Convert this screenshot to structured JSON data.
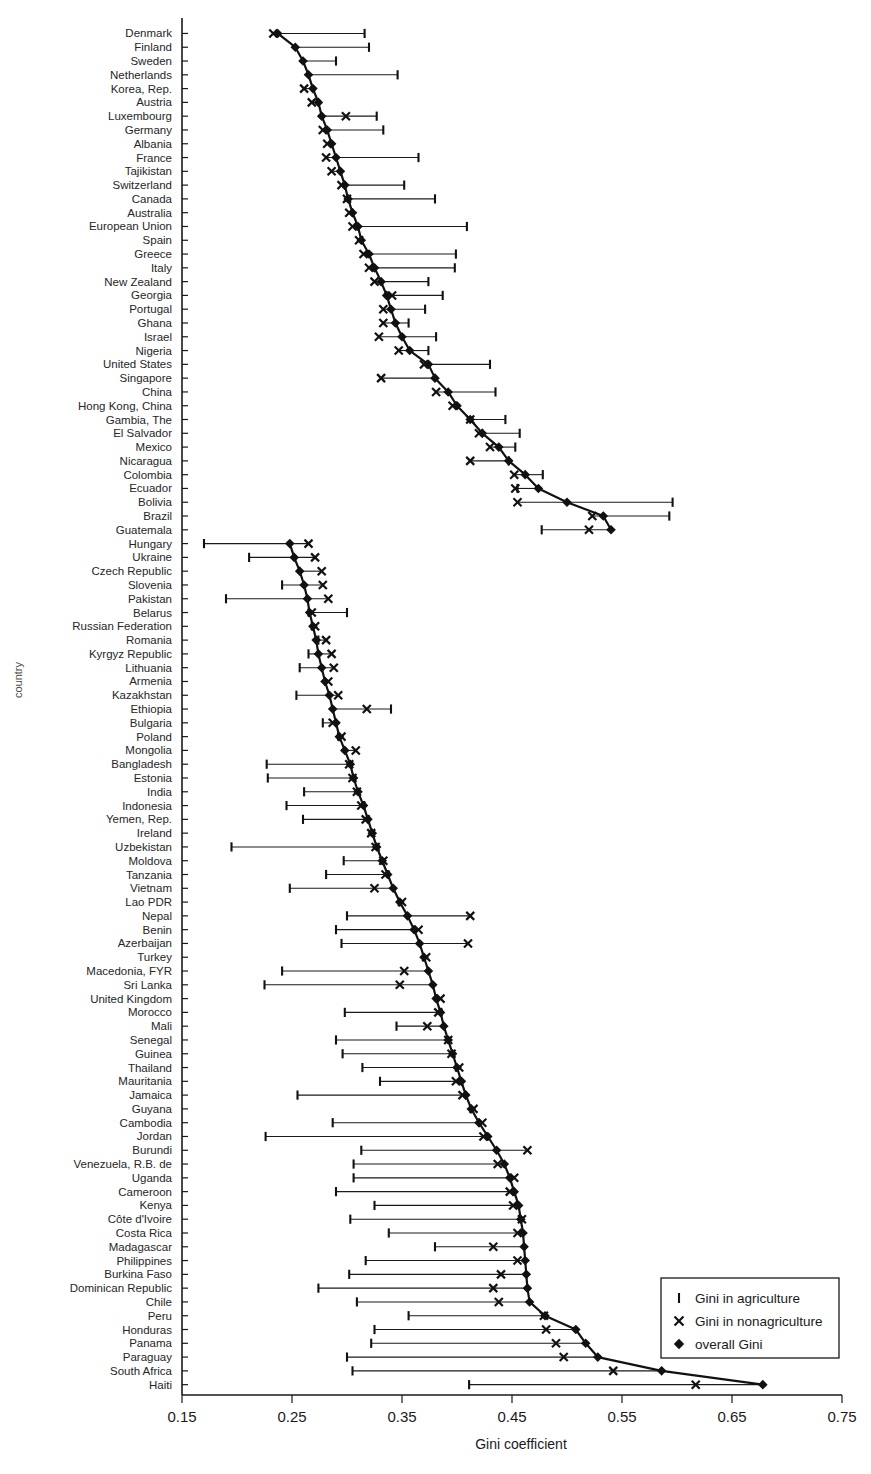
{
  "chart_data": {
    "type": "scatter",
    "title": "",
    "xlabel": "Gini coefficient",
    "ylabel": "country",
    "xlim": [
      0.15,
      0.75
    ],
    "ylim_note": "categorical, 101 countries ordered by overall Gini within two sorted groups",
    "grid": false,
    "xticks": [
      "0.15",
      "0.25",
      "0.35",
      "0.45",
      "0.55",
      "0.65",
      "0.75"
    ],
    "xtick_values": [
      0.15,
      0.25,
      0.35,
      0.45,
      0.55,
      0.65,
      0.75
    ],
    "legend_position": "bottom-right",
    "legend": [
      {
        "key": "agriculture",
        "marker": "vertical-bar",
        "label": "Gini in agriculture"
      },
      {
        "key": "nonagriculture",
        "marker": "x-cross",
        "label": "Gini in nonagriculture"
      },
      {
        "key": "overall",
        "marker": "diamond",
        "label": "overall Gini"
      }
    ],
    "series_names": [
      "Gini in agriculture",
      "Gini in nonagriculture",
      "overall Gini"
    ],
    "categories": [
      "Denmark",
      "Finland",
      "Sweden",
      "Netherlands",
      "Korea, Rep.",
      "Austria",
      "Luxembourg",
      "Germany",
      "Albania",
      "France",
      "Tajikistan",
      "Switzerland",
      "Canada",
      "Australia",
      "European Union",
      "Spain",
      "Greece",
      "Italy",
      "New Zealand",
      "Georgia",
      "Portugal",
      "Ghana",
      "Israel",
      "Nigeria",
      "United States",
      "Singapore",
      "China",
      "Hong Kong, China",
      "Gambia, The",
      "El Salvador",
      "Mexico",
      "Nicaragua",
      "Colombia",
      "Ecuador",
      "Bolivia",
      "Brazil",
      "Guatemala",
      "Hungary",
      "Ukraine",
      "Czech Republic",
      "Slovenia",
      "Pakistan",
      "Belarus",
      "Russian Federation",
      "Romania",
      "Kyrgyz Republic",
      "Lithuania",
      "Armenia",
      "Kazakhstan",
      "Ethiopia",
      "Bulgaria",
      "Poland",
      "Mongolia",
      "Bangladesh",
      "Estonia",
      "India",
      "Indonesia",
      "Yemen, Rep.",
      "Ireland",
      "Uzbekistan",
      "Moldova",
      "Tanzania",
      "Vietnam",
      "Lao PDR",
      "Nepal",
      "Benin",
      "Azerbaijan",
      "Turkey",
      "Macedonia, FYR",
      "Sri Lanka",
      "United Kingdom",
      "Morocco",
      "Mali",
      "Senegal",
      "Guinea",
      "Thailand",
      "Mauritania",
      "Jamaica",
      "Guyana",
      "Cambodia",
      "Jordan",
      "Burundi",
      "Venezuela, R.B. de",
      "Uganda",
      "Cameroon",
      "Kenya",
      "Côte d'Ivoire",
      "Costa Rica",
      "Madagascar",
      "Philippines",
      "Burkina Faso",
      "Dominican Republic",
      "Chile",
      "Peru",
      "Honduras",
      "Panama",
      "Paraguay",
      "South Africa",
      "Haiti"
    ],
    "series": [
      {
        "name": "overall Gini",
        "marker": "diamond",
        "values": [
          0.237,
          0.253,
          0.26,
          0.265,
          0.269,
          0.274,
          0.277,
          0.282,
          0.286,
          0.29,
          0.294,
          0.298,
          0.301,
          0.305,
          0.31,
          0.313,
          0.32,
          0.325,
          0.331,
          0.336,
          0.34,
          0.344,
          0.35,
          0.357,
          0.374,
          0.38,
          0.392,
          0.4,
          0.412,
          0.423,
          0.438,
          0.447,
          0.462,
          0.474,
          0.5,
          0.533,
          0.54,
          0.248,
          0.252,
          0.257,
          0.261,
          0.264,
          0.266,
          0.269,
          0.272,
          0.274,
          0.277,
          0.28,
          0.284,
          0.287,
          0.29,
          0.293,
          0.298,
          0.303,
          0.306,
          0.31,
          0.315,
          0.319,
          0.323,
          0.327,
          0.332,
          0.337,
          0.342,
          0.348,
          0.355,
          0.361,
          0.366,
          0.37,
          0.374,
          0.378,
          0.381,
          0.385,
          0.388,
          0.392,
          0.396,
          0.4,
          0.404,
          0.408,
          0.413,
          0.42,
          0.428,
          0.436,
          0.443,
          0.448,
          0.452,
          0.456,
          0.458,
          0.46,
          0.461,
          0.462,
          0.463,
          0.464,
          0.466,
          0.48,
          0.508,
          0.517,
          0.528,
          0.586,
          0.678
        ]
      },
      {
        "name": "Gini in agriculture",
        "marker": "vertical-bar",
        "values": [
          0.316,
          0.32,
          0.29,
          0.346,
          null,
          null,
          0.327,
          0.333,
          null,
          0.365,
          null,
          0.352,
          0.38,
          null,
          0.409,
          null,
          0.399,
          0.398,
          0.374,
          0.387,
          0.371,
          0.356,
          0.381,
          0.374,
          0.43,
          null,
          0.435,
          null,
          0.444,
          0.457,
          0.453,
          0.447,
          0.478,
          0.455,
          0.596,
          0.593,
          0.477,
          0.17,
          0.211,
          null,
          0.241,
          0.19,
          0.3,
          null,
          0.274,
          0.265,
          0.257,
          null,
          0.254,
          0.34,
          0.278,
          null,
          null,
          0.227,
          0.228,
          0.261,
          0.245,
          0.26,
          null,
          0.195,
          0.297,
          0.281,
          0.248,
          null,
          0.3,
          0.29,
          0.295,
          null,
          0.241,
          0.225,
          null,
          0.298,
          0.345,
          0.29,
          0.296,
          0.314,
          0.33,
          0.255,
          null,
          0.287,
          0.226,
          0.313,
          0.306,
          0.306,
          0.29,
          0.325,
          0.303,
          0.338,
          0.38,
          0.317,
          0.302,
          0.274,
          0.309,
          0.356,
          0.325,
          0.322,
          0.3,
          0.305,
          0.411
        ]
      },
      {
        "name": "Gini in nonagriculture",
        "marker": "x-cross",
        "values": [
          0.233,
          null,
          null,
          null,
          0.261,
          0.268,
          0.299,
          0.278,
          0.282,
          0.281,
          0.286,
          0.295,
          0.3,
          0.302,
          0.305,
          0.311,
          0.315,
          0.32,
          0.325,
          0.341,
          0.333,
          0.333,
          0.329,
          0.347,
          0.37,
          0.331,
          0.381,
          0.396,
          0.412,
          0.42,
          0.43,
          0.412,
          0.452,
          0.453,
          0.455,
          0.523,
          0.52,
          0.265,
          0.271,
          0.277,
          0.278,
          0.283,
          0.268,
          0.271,
          0.281,
          0.286,
          0.288,
          0.283,
          0.292,
          0.318,
          0.287,
          0.295,
          0.308,
          0.302,
          0.305,
          0.309,
          0.313,
          0.317,
          0.322,
          0.326,
          0.333,
          0.335,
          0.325,
          0.35,
          0.412,
          0.365,
          0.41,
          0.372,
          0.352,
          0.348,
          0.385,
          0.383,
          0.373,
          0.392,
          0.395,
          0.402,
          0.399,
          0.405,
          0.415,
          0.423,
          0.424,
          0.464,
          0.437,
          0.452,
          0.448,
          0.451,
          0.459,
          0.455,
          0.433,
          0.455,
          0.44,
          0.433,
          0.438,
          0.479,
          0.481,
          0.49,
          0.497,
          0.542,
          0.617
        ]
      }
    ]
  }
}
